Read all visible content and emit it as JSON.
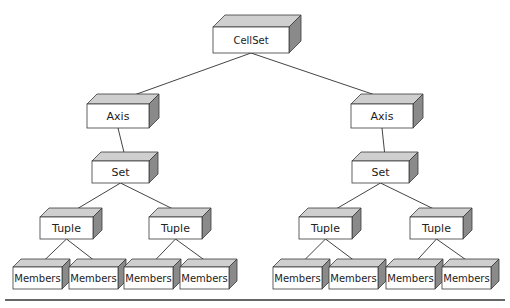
{
  "colors": {
    "front": "#ffffff",
    "top": "#cfcfcf",
    "side": "#8a8a8a",
    "stroke": "#3a3a3a",
    "line": "#444444"
  },
  "diagram": {
    "title": "",
    "nodes": [
      {
        "id": "cellset",
        "label": "CellSet",
        "x": 213,
        "y": 27,
        "w": 76,
        "h": 26,
        "d": 12
      },
      {
        "id": "axis-left",
        "label": "Axis",
        "x": 87,
        "y": 104,
        "w": 62,
        "h": 24,
        "d": 10
      },
      {
        "id": "axis-right",
        "label": "Axis",
        "x": 351,
        "y": 104,
        "w": 62,
        "h": 24,
        "d": 10
      },
      {
        "id": "set-left",
        "label": "Set",
        "x": 92,
        "y": 161,
        "w": 57,
        "h": 22,
        "d": 9
      },
      {
        "id": "set-right",
        "label": "Set",
        "x": 352,
        "y": 161,
        "w": 57,
        "h": 22,
        "d": 9
      },
      {
        "id": "tuple-1",
        "label": "Tuple",
        "x": 40,
        "y": 217,
        "w": 53,
        "h": 22,
        "d": 9
      },
      {
        "id": "tuple-2",
        "label": "Tuple",
        "x": 149,
        "y": 217,
        "w": 53,
        "h": 22,
        "d": 9
      },
      {
        "id": "tuple-3",
        "label": "Tuple",
        "x": 299,
        "y": 217,
        "w": 53,
        "h": 22,
        "d": 9
      },
      {
        "id": "tuple-4",
        "label": "Tuple",
        "x": 410,
        "y": 217,
        "w": 53,
        "h": 22,
        "d": 9
      },
      {
        "id": "members-1",
        "label": "Members",
        "x": 13,
        "y": 267,
        "w": 49,
        "h": 22,
        "d": 8
      },
      {
        "id": "members-2",
        "label": "Members",
        "x": 69,
        "y": 267,
        "w": 49,
        "h": 22,
        "d": 8
      },
      {
        "id": "members-3",
        "label": "Members",
        "x": 124,
        "y": 267,
        "w": 49,
        "h": 22,
        "d": 8
      },
      {
        "id": "members-4",
        "label": "Members",
        "x": 180,
        "y": 267,
        "w": 49,
        "h": 22,
        "d": 8
      },
      {
        "id": "members-5",
        "label": "Members",
        "x": 273,
        "y": 267,
        "w": 49,
        "h": 22,
        "d": 8
      },
      {
        "id": "members-6",
        "label": "Members",
        "x": 329,
        "y": 267,
        "w": 49,
        "h": 22,
        "d": 8
      },
      {
        "id": "members-7",
        "label": "Members",
        "x": 386,
        "y": 267,
        "w": 49,
        "h": 22,
        "d": 8
      },
      {
        "id": "members-8",
        "label": "Members",
        "x": 442,
        "y": 267,
        "w": 49,
        "h": 22,
        "d": 8
      }
    ],
    "edges": [
      {
        "from": "cellset",
        "to": "axis-left"
      },
      {
        "from": "cellset",
        "to": "axis-right"
      },
      {
        "from": "axis-left",
        "to": "set-left"
      },
      {
        "from": "axis-right",
        "to": "set-right"
      },
      {
        "from": "set-left",
        "to": "tuple-1"
      },
      {
        "from": "set-left",
        "to": "tuple-2"
      },
      {
        "from": "set-right",
        "to": "tuple-3"
      },
      {
        "from": "set-right",
        "to": "tuple-4"
      },
      {
        "from": "tuple-1",
        "to": "members-1"
      },
      {
        "from": "tuple-1",
        "to": "members-2"
      },
      {
        "from": "tuple-2",
        "to": "members-3"
      },
      {
        "from": "tuple-2",
        "to": "members-4"
      },
      {
        "from": "tuple-3",
        "to": "members-5"
      },
      {
        "from": "tuple-3",
        "to": "members-6"
      },
      {
        "from": "tuple-4",
        "to": "members-7"
      },
      {
        "from": "tuple-4",
        "to": "members-8"
      }
    ],
    "rule": {
      "x1": 5,
      "x2": 505,
      "y": 300
    }
  }
}
